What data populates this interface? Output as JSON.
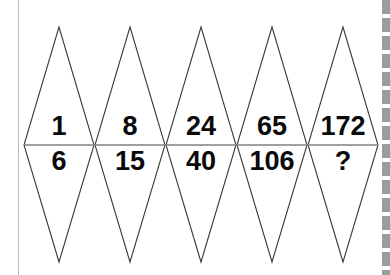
{
  "puzzle": {
    "type": "number-sequence-diamond-puzzle",
    "background_color": "#ffffff",
    "outline_color": "#3a3a3a",
    "midline_color": "#808080",
    "text_color": "#0a0a0a",
    "diamond_count": 5,
    "cells": [
      {
        "index": 1,
        "top": "1",
        "bottom": "6"
      },
      {
        "index": 2,
        "top": "8",
        "bottom": "15"
      },
      {
        "index": 3,
        "top": "24",
        "bottom": "40"
      },
      {
        "index": 4,
        "top": "65",
        "bottom": "106"
      },
      {
        "index": 5,
        "top": "172",
        "bottom": "?"
      }
    ],
    "top_row_values": [
      "1",
      "8",
      "24",
      "65",
      "172"
    ],
    "bottom_row_values": [
      "6",
      "15",
      "40",
      "106",
      "?"
    ],
    "unknown_marker": "?"
  },
  "chrome": {
    "left_border_name": "left-page-border",
    "scrollbar_name": "right-scrollbar"
  }
}
